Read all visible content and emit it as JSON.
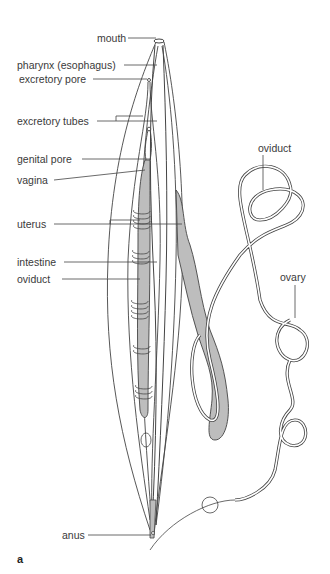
{
  "figure": {
    "panel_label": "a",
    "colors": {
      "outline": "#444444",
      "fill_gray": "#bdbdbd",
      "background": "#ffffff",
      "text": "#3a3a3a"
    },
    "labels_left": [
      {
        "id": "mouth",
        "text": "mouth"
      },
      {
        "id": "pharynx",
        "text": "pharynx (esophagus)"
      },
      {
        "id": "excretory-pore",
        "text": "excretory pore"
      },
      {
        "id": "excretory-tubes",
        "text": "excretory tubes"
      },
      {
        "id": "genital-pore",
        "text": "genital pore"
      },
      {
        "id": "vagina",
        "text": "vagina"
      },
      {
        "id": "uterus",
        "text": "uterus"
      },
      {
        "id": "intestine",
        "text": "intestine"
      },
      {
        "id": "oviduct-left",
        "text": "oviduct"
      },
      {
        "id": "anus",
        "text": "anus"
      }
    ],
    "labels_right": [
      {
        "id": "oviduct-right",
        "text": "oviduct"
      },
      {
        "id": "ovary",
        "text": "ovary"
      }
    ]
  }
}
